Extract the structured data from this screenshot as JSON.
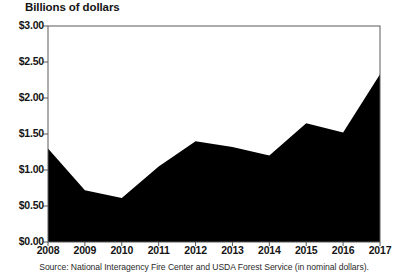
{
  "chart_data": {
    "type": "area",
    "title": "Billions of dollars",
    "xlabel": "",
    "ylabel": "Billions of dollars",
    "categories": [
      "2008",
      "2009",
      "2010",
      "2011",
      "2012",
      "2013",
      "2014",
      "2015",
      "2016",
      "2017"
    ],
    "values": [
      1.3,
      0.72,
      0.61,
      1.05,
      1.4,
      1.32,
      1.2,
      1.65,
      1.52,
      2.33
    ],
    "series": [
      {
        "name": "Federal wildfire suppression spending",
        "values": [
          1.3,
          0.72,
          0.61,
          1.05,
          1.4,
          1.32,
          1.2,
          1.65,
          1.52,
          2.33
        ]
      }
    ],
    "ylim": [
      0,
      3.0
    ],
    "ytick_values": [
      0,
      0.5,
      1.0,
      1.5,
      2.0,
      2.5,
      3.0
    ],
    "ytick_labels": [
      "$0.00",
      "$0.50",
      "$1.00",
      "$1.50",
      "$2.00",
      "$2.50",
      "$3.00"
    ],
    "grid": false,
    "legend": "none",
    "fill_color": "#000000",
    "axis_color": "#4a4a4a",
    "plot_background": "#ffffff",
    "source": "Source: National Interagency Fire Center and USDA Forest Service (in nominal dollars)."
  }
}
